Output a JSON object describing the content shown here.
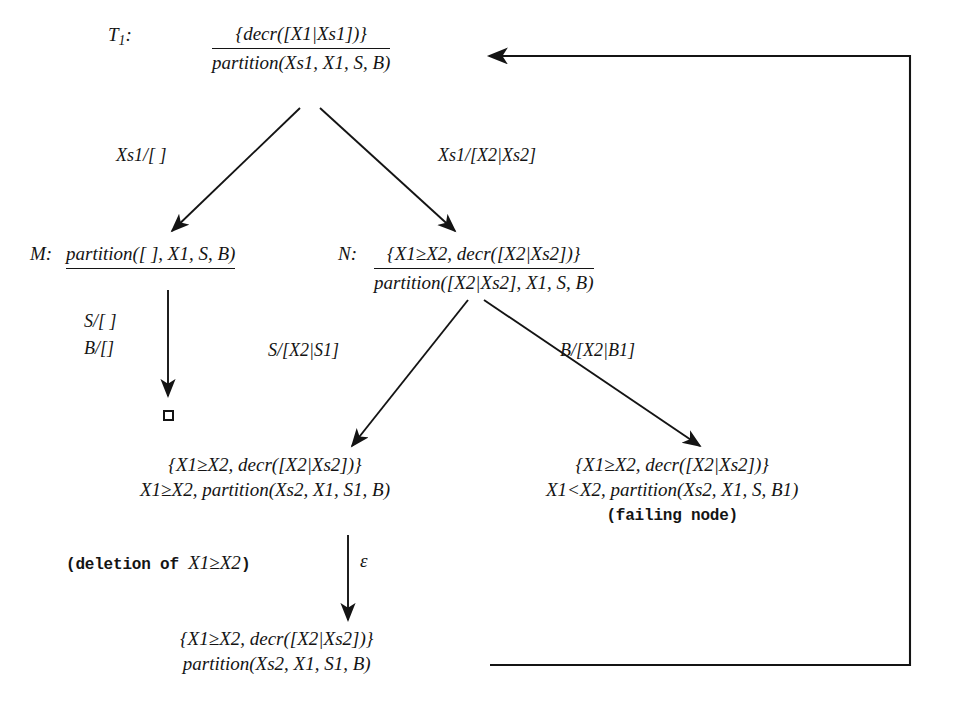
{
  "diagram": {
    "nodes": {
      "root": {
        "tag": "T",
        "tag_sub": "1",
        "tag_colon": ":",
        "line1": "{decr([X1|Xs1])}",
        "line2": "partition(Xs1, X1, S, B)",
        "has_rule_line": true
      },
      "m": {
        "tag": "M:",
        "line1": "partition([ ], X1, S, B)",
        "has_rule_line": true
      },
      "n": {
        "tag": "N:",
        "line1": "{X1≥X2, decr([X2|Xs2])}",
        "line2": "partition([X2|Xs2], X1, S, B)",
        "has_rule_line": true
      },
      "empty_clause": {
        "symbol": "□",
        "name": "empty-clause-box"
      },
      "left_leaf": {
        "line1": "{X1≥X2, decr([X2|Xs2])}",
        "line2": "X1≥X2, partition(Xs2, X1, S1, B)"
      },
      "right_leaf": {
        "line1": "{X1≥X2, decr([X2|Xs2])}",
        "line2": "X1<X2, partition(Xs2, X1, S, B1)",
        "line3": "(failing node)"
      },
      "bottom": {
        "line1": "{X1≥X2, decr([X2|Xs2])}",
        "line2": "partition(Xs2, X1, S1, B)"
      }
    },
    "edge_labels": {
      "root_left": "Xs1/[ ]",
      "root_right": "Xs1/[X2|Xs2]",
      "m_down_1": "S/[ ]",
      "m_down_2": "B/[]",
      "n_left": "S/[X2|S1]",
      "n_right": "B/[X2|B1]",
      "deletion_note": "(deletion of ",
      "deletion_note_math": "X1≥X2",
      "deletion_note_end": ")",
      "epsilon": "ε"
    },
    "colors": {
      "ink": "#141414",
      "background": "#ffffff"
    }
  }
}
